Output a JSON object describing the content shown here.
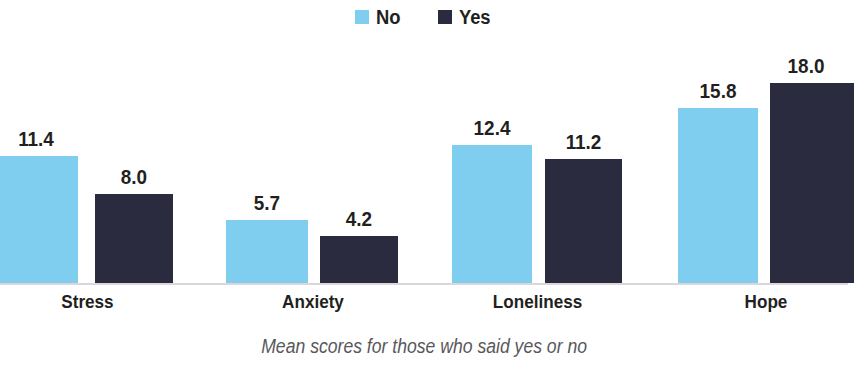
{
  "legend": {
    "position": "top-center",
    "items": [
      {
        "label": "No",
        "color": "#7fcdef"
      },
      {
        "label": "Yes",
        "color": "#2b2b3f"
      }
    ]
  },
  "caption": "Mean scores for those who said yes or no",
  "axis": {
    "baseline_color": "#d8d8dc",
    "grid": false
  },
  "chart_data": {
    "type": "bar",
    "title": "",
    "subtitle": "",
    "xlabel": "",
    "ylabel": "",
    "categories": [
      "Stress",
      "Anxiety",
      "Loneliness",
      "Hope"
    ],
    "series": [
      {
        "name": "No",
        "color": "#7fcdef",
        "values": [
          11.4,
          5.7,
          12.4,
          15.8
        ]
      },
      {
        "name": "Yes",
        "color": "#2b2b3f",
        "values": [
          8.0,
          4.2,
          11.2,
          18.0
        ]
      }
    ],
    "value_labels": [
      [
        "11.4",
        "8.0"
      ],
      [
        "5.7",
        "4.2"
      ],
      [
        "12.4",
        "11.2"
      ],
      [
        "15.8",
        "18.0"
      ]
    ],
    "ylim": [
      0,
      18.0
    ],
    "legend_position": "top-center",
    "grid": false,
    "annotations": [
      "Mean scores for those who said yes or no"
    ]
  },
  "layout": {
    "baseline_y": 283,
    "px_per_unit": 11.1,
    "bars": [
      {
        "group": "Stress",
        "series": "No",
        "x": -6,
        "width": 84,
        "label_x": -6,
        "label_w": 84
      },
      {
        "group": "Stress",
        "series": "Yes",
        "x": 95,
        "width": 78,
        "label_x": 95,
        "label_w": 78
      },
      {
        "group": "Anxiety",
        "series": "No",
        "x": 226,
        "width": 82,
        "label_x": 226,
        "label_w": 82
      },
      {
        "group": "Anxiety",
        "series": "Yes",
        "x": 320,
        "width": 78,
        "label_x": 320,
        "label_w": 78
      },
      {
        "group": "Loneliness",
        "series": "No",
        "x": 452,
        "width": 80,
        "label_x": 452,
        "label_w": 80
      },
      {
        "group": "Loneliness",
        "series": "Yes",
        "x": 545,
        "width": 77,
        "label_x": 545,
        "label_w": 77
      },
      {
        "group": "Hope",
        "series": "No",
        "x": 678,
        "width": 80,
        "label_x": 678,
        "label_w": 80
      },
      {
        "group": "Hope",
        "series": "Yes",
        "x": 770,
        "width": 84,
        "label_x": 764,
        "label_w": 84
      }
    ],
    "category_label_positions": [
      {
        "x": 0,
        "width": 175
      },
      {
        "x": 228,
        "width": 170
      },
      {
        "x": 450,
        "width": 175
      },
      {
        "x": 678,
        "width": 176
      }
    ]
  }
}
